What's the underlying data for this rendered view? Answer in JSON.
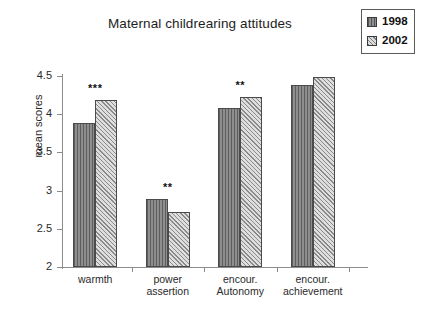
{
  "chart_data": {
    "type": "bar",
    "title": "Maternal childrearing attitudes",
    "xlabel": "",
    "ylabel": "mean scores",
    "ylim": [
      2,
      4.5
    ],
    "yticks": [
      "2",
      "2.5",
      "3",
      "3.5",
      "4",
      "4.5"
    ],
    "grid": false,
    "legend_position": "top-right",
    "categories": [
      "warmth",
      "power assertion",
      "encour. Autonomy",
      "encour. achievement"
    ],
    "category_lines": [
      [
        "warmth"
      ],
      [
        "power",
        "assertion"
      ],
      [
        "encour.",
        "Autonomy"
      ],
      [
        "encour.",
        "achievement"
      ]
    ],
    "series": [
      {
        "name": "1998",
        "swatch": "vertical-stripe-dark",
        "color": "#8e8e8e",
        "values": [
          3.89,
          2.89,
          4.08,
          4.38
        ]
      },
      {
        "name": "2002",
        "swatch": "diagonal-hatch-light",
        "color": "#dedede",
        "values": [
          4.19,
          2.72,
          4.22,
          4.49
        ]
      }
    ],
    "annotations": [
      {
        "category": "warmth",
        "text": "***"
      },
      {
        "category": "power assertion",
        "text": "**"
      },
      {
        "category": "encour. Autonomy",
        "text": "**"
      },
      {
        "category": "encour. achievement",
        "text": ""
      }
    ]
  }
}
